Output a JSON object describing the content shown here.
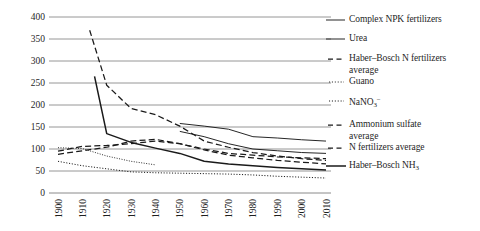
{
  "chart_data": {
    "type": "line",
    "title": "",
    "xlabel": "",
    "ylabel": "",
    "xlim": [
      1900,
      2010
    ],
    "ylim": [
      0,
      400
    ],
    "ytick_labels": [
      "400",
      "350",
      "300",
      "250",
      "200",
      "150",
      "100",
      "50",
      "0"
    ],
    "ytick_values": [
      400,
      350,
      300,
      250,
      200,
      150,
      100,
      50,
      0
    ],
    "xtick_labels": [
      "1900",
      "1910",
      "1920",
      "1930",
      "1940",
      "1950",
      "1960",
      "1970",
      "1980",
      "1990",
      "2000",
      "2010"
    ],
    "xtick_values": [
      1900,
      1910,
      1920,
      1930,
      1940,
      1950,
      1960,
      1970,
      1980,
      1990,
      2000,
      2010
    ],
    "grid": "horizontal",
    "legend_position": "right",
    "series": [
      {
        "name": "Complex NPK fertilizers",
        "style": "solid",
        "x": [
          1950,
          1960,
          1970,
          1980,
          1990,
          2000,
          2010
        ],
        "y": [
          158,
          152,
          145,
          128,
          125,
          121,
          118
        ]
      },
      {
        "name": "Urea",
        "style": "solid",
        "x": [
          1950,
          1960,
          1970,
          1980,
          1990,
          2000,
          2010
        ],
        "y": [
          140,
          128,
          112,
          100,
          96,
          92,
          90
        ]
      },
      {
        "name": "Haber-Bosch N fertilizers average",
        "style": "dashed",
        "x": [
          1913,
          1920,
          1930,
          1940,
          1950,
          1960,
          1970,
          1980,
          1990,
          2000,
          2010
        ],
        "y": [
          370,
          245,
          192,
          178,
          152,
          118,
          104,
          92,
          84,
          78,
          74
        ]
      },
      {
        "name": "Guano",
        "style": "dotted-fine",
        "x": [
          1900,
          1910,
          1920,
          1930,
          1940
        ],
        "y": [
          103,
          101,
          84,
          72,
          64
        ]
      },
      {
        "name": "NaNO3-",
        "style": "dotted",
        "x": [
          1900,
          1910,
          1920,
          1930,
          1940,
          1950,
          1960,
          1970,
          1980,
          1990,
          2000,
          2010
        ],
        "y": [
          72,
          62,
          55,
          48,
          46,
          45,
          44,
          43,
          41,
          38,
          36,
          34
        ]
      },
      {
        "name": "Ammonium sulfate average",
        "style": "dashed",
        "x": [
          1900,
          1910,
          1920,
          1930,
          1940,
          1950,
          1960,
          1970,
          1980,
          1990,
          2000,
          2010
        ],
        "y": [
          95,
          106,
          108,
          112,
          118,
          112,
          100,
          90,
          86,
          82,
          80,
          78
        ]
      },
      {
        "name": "N fertilizers average",
        "style": "dashed",
        "x": [
          1900,
          1910,
          1920,
          1930,
          1940,
          1950,
          1960,
          1970,
          1980,
          1990,
          2000,
          2010
        ],
        "y": [
          88,
          96,
          104,
          118,
          122,
          112,
          98,
          86,
          80,
          74,
          70,
          66
        ]
      },
      {
        "name": "Haber-Bosch NH3",
        "style": "solid-thick",
        "x": [
          1915,
          1920,
          1930,
          1940,
          1950,
          1960,
          1970,
          1980,
          1990,
          2000,
          2010
        ],
        "y": [
          265,
          135,
          115,
          102,
          90,
          72,
          66,
          62,
          58,
          55,
          52
        ]
      }
    ]
  },
  "legend": {
    "items": [
      {
        "label": "Complex NPK fertilizers",
        "style": "solid",
        "cont": ""
      },
      {
        "label": "Urea",
        "style": "solid",
        "cont": ""
      },
      {
        "label": "Haber–Bosch N fertilizers",
        "style": "dashed",
        "cont": "average"
      },
      {
        "label": "Guano",
        "style": "dotted-fine",
        "cont": ""
      },
      {
        "label": "NaNO",
        "style": "dotted",
        "cont": "",
        "sub": "3",
        "sup": "−"
      },
      {
        "label": "Ammonium sulfate",
        "style": "dashed",
        "cont": "average"
      },
      {
        "label": "N fertilizers average",
        "style": "dashed",
        "cont": ""
      },
      {
        "label": "Haber–Bosch NH",
        "style": "solid-thick",
        "cont": "",
        "sub": "3"
      }
    ]
  },
  "colors": {
    "line": "#1a1a1a",
    "grid": "#8a8a8a",
    "text": "#1f1f1f",
    "background": "#ffffff"
  }
}
